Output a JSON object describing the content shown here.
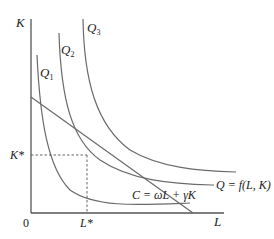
{
  "diagram": {
    "type": "isoquant-isocost",
    "axes": {
      "y_label": "K",
      "x_label": "L",
      "origin_label": "0"
    },
    "isoquants": [
      {
        "label": "Q",
        "subscript": "1"
      },
      {
        "label": "Q",
        "subscript": "2"
      },
      {
        "label": "Q",
        "subscript": "3"
      }
    ],
    "equilibrium": {
      "k_star": "K*",
      "l_star": "L*"
    },
    "isocost_label": "C = ωL + γK",
    "production_function_label": "Q = f(L, K)",
    "colors": {
      "curve": "#6a6a6a",
      "axis": "#555555",
      "text": "#222222"
    }
  }
}
